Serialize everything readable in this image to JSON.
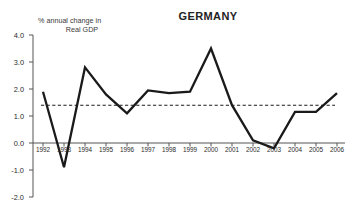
{
  "chart_data": {
    "type": "line",
    "title": "GERMANY",
    "axis_note_line1": "% annual change in",
    "axis_note_line2": "Real GDP",
    "xlabel": "",
    "ylabel": "",
    "ylim": [
      -2.0,
      4.0
    ],
    "yticks": [
      "4.0",
      "3.0",
      "2.0",
      "1.0",
      "0.0",
      "-1.0",
      "-2.0"
    ],
    "ytick_values": [
      4.0,
      3.0,
      2.0,
      1.0,
      0.0,
      -1.0,
      -2.0
    ],
    "grid": false,
    "legend": "none",
    "categories": [
      "1992",
      "1993",
      "1994",
      "1995",
      "1996",
      "1997",
      "1998",
      "1999",
      "2000",
      "2001",
      "2002",
      "2003",
      "2004",
      "2005",
      "2006"
    ],
    "values": [
      1.9,
      -0.9,
      2.8,
      1.8,
      1.1,
      1.95,
      1.85,
      1.9,
      3.5,
      1.4,
      0.1,
      -0.2,
      1.15,
      1.15,
      1.85
    ],
    "series": [
      {
        "name": "Real GDP annual % change",
        "values": [
          1.9,
          -0.9,
          2.8,
          1.8,
          1.1,
          1.95,
          1.85,
          1.9,
          3.5,
          1.4,
          0.1,
          -0.2,
          1.15,
          1.15,
          1.85
        ],
        "color": "#1a1a1a",
        "style": "solid"
      }
    ],
    "reference_line": {
      "label": "average",
      "value": 1.4,
      "style": "dashed",
      "color": "#1a1a1a"
    },
    "zero_line": 0.0,
    "colors": {
      "line": "#1a1a1a",
      "axis": "#555555",
      "text": "#222222",
      "background": "#ffffff"
    }
  }
}
